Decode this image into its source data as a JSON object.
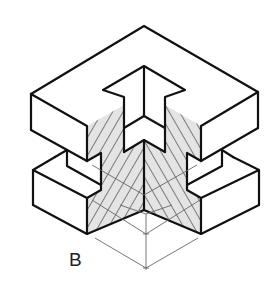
{
  "figure": {
    "label": "B",
    "colors": {
      "outline": "#111111",
      "hatch_fill": "#e4e4e4",
      "hatch_line": "#222222",
      "dimension_line": "#666666",
      "background": "#ffffff"
    }
  }
}
